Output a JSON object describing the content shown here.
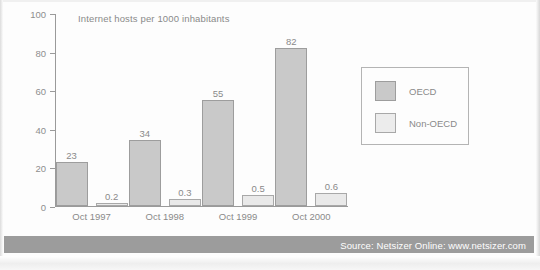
{
  "chart_data": {
    "type": "bar",
    "title": "Internet hosts per 1000 inhabitants",
    "xlabel": "",
    "ylabel": "",
    "ylim": [
      0,
      100
    ],
    "yticks": [
      0,
      20,
      40,
      60,
      80,
      100
    ],
    "ytick_labels": [
      "0",
      "20",
      "40",
      "60",
      "80",
      "100"
    ],
    "grid": false,
    "legend_position": "right",
    "categories": [
      "Oct 1997",
      "Oct 1998",
      "Oct 1999",
      "Oct 2000"
    ],
    "series": [
      {
        "name": "OECD",
        "color": "#c9c9c9",
        "values": [
          23,
          34,
          55,
          82
        ],
        "labels": [
          "23",
          "34",
          "55",
          "82"
        ]
      },
      {
        "name": "Non-OECD",
        "color": "#e9e9e9",
        "values": [
          0.2,
          0.3,
          0.5,
          0.6
        ],
        "labels": [
          "0.2",
          "0.3",
          "0.5",
          "0.6"
        ]
      }
    ]
  },
  "footer": {
    "source": "Source: Netsizer Online: www.netsizer.com",
    "band_color": "#9c9c9c"
  }
}
